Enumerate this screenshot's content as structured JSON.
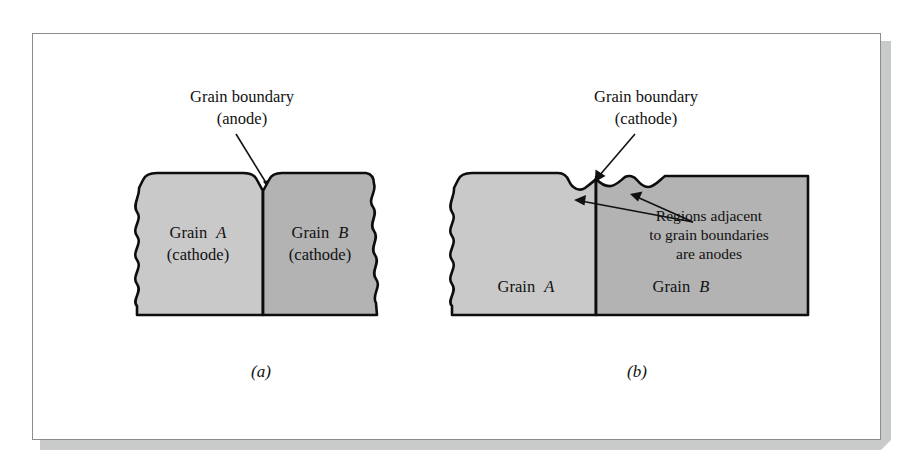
{
  "figure": {
    "frame": {
      "border_color": "#8a8d8d",
      "background_color": "#ffffff",
      "shadow_color": "#c9cbcb"
    },
    "colors": {
      "grain_a_fill": "#c9c9c9",
      "grain_b_fill": "#b3b3b3",
      "outline": "#0d0d0d",
      "text": "#111111"
    },
    "panels": [
      {
        "id": "panel-a",
        "sublabel": "(a)",
        "callout": {
          "line1": "Grain boundary",
          "line2": "(anode)"
        },
        "grains": [
          {
            "id": "grain-a-left",
            "name_line1_prefix": "Grain",
            "name_line1_letter": "A",
            "name_line2": "(cathode)",
            "fill": "#c9c9c9"
          },
          {
            "id": "grain-b-right",
            "name_line1_prefix": "Grain",
            "name_line1_letter": "B",
            "name_line2": "(cathode)",
            "fill": "#b3b3b3"
          }
        ]
      },
      {
        "id": "panel-b",
        "sublabel": "(b)",
        "callout": {
          "line1": "Grain boundary",
          "line2": "(cathode)"
        },
        "annotation": {
          "line1": "Regions adjacent",
          "line2": "to grain boundaries",
          "line3": "are anodes"
        },
        "grains": [
          {
            "id": "grain-a-left",
            "name_line1_prefix": "Grain",
            "name_line1_letter": "A",
            "name_line2": "",
            "fill": "#c9c9c9"
          },
          {
            "id": "grain-b-right",
            "name_line1_prefix": "Grain",
            "name_line1_letter": "B",
            "name_line2": "",
            "fill": "#b3b3b3"
          }
        ]
      }
    ]
  }
}
